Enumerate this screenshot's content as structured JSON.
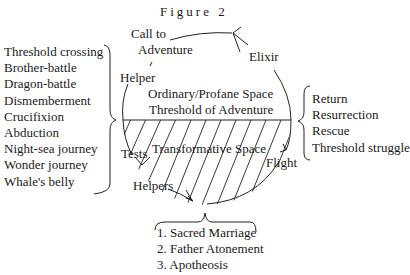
{
  "title": "Figure 2",
  "cycle_labels": {
    "call_to": "Call to",
    "adventure": "Adventure",
    "elixir": "Elixir",
    "helper": "Helper",
    "ordinary_space": "Ordinary/Profane Space",
    "threshold": "Threshold of Adventure",
    "transformative_space": "Transformative Space",
    "tests": "Tests",
    "flight": "Flight",
    "helpers": "Helpers"
  },
  "left_list": [
    "Threshold crossing",
    "Brother-battle",
    "Dragon-battle",
    "Dismemberment",
    "Crucifixion",
    "Abduction",
    "Night-sea journey",
    "Wonder journey",
    "Whale's belly"
  ],
  "right_list": [
    "Return",
    "Resurrection",
    "Rescue",
    "Threshold struggle"
  ],
  "bottom_list": [
    "1. Sacred Marriage",
    "2. Father Atonement",
    "3. Apotheosis"
  ]
}
